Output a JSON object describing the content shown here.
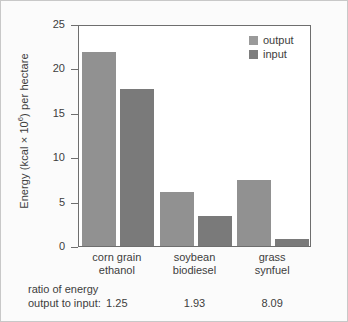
{
  "chart_data": {
    "type": "bar",
    "title": "",
    "xlabel": "",
    "ylabel": "Energy (kcal × 10⁶) per hectare",
    "ylabel_main": "Energy (kcal × 10",
    "ylabel_sup": "6",
    "ylabel_tail": ") per hectare",
    "ylim": [
      0,
      25
    ],
    "yticks": [
      25,
      20,
      15,
      10,
      5,
      0
    ],
    "grid": false,
    "legend_position": "top-right",
    "categories": [
      "corn grain ethanol",
      "soybean biodiesel",
      "grass synfuel"
    ],
    "categories_lines": [
      [
        "corn grain",
        "ethanol"
      ],
      [
        "soybean",
        "biodiesel"
      ],
      [
        "grass",
        "synfuel"
      ]
    ],
    "series": [
      {
        "name": "output",
        "color": "#919191",
        "values": [
          22.0,
          6.2,
          7.6
        ]
      },
      {
        "name": "input",
        "color": "#7a7a7a",
        "values": [
          17.8,
          3.5,
          0.9
        ]
      }
    ],
    "annotations": {
      "ratio_caption_line1": "ratio of energy",
      "ratio_caption_line2": "output to input:",
      "ratio_values": [
        "1.25",
        "1.93",
        "8.09"
      ]
    }
  },
  "legend": {
    "items": [
      {
        "label": "output",
        "color": "#9a9a9a"
      },
      {
        "label": "input",
        "color": "#7d7d7d"
      }
    ]
  },
  "colors": {
    "output_bar": "#919191",
    "input_bar": "#7a7a7a",
    "axis": "#6e6e6e",
    "text": "#3d3d3d",
    "figure_background": "#fbfbfb",
    "plot_background": "#ffffff",
    "figure_border": "#c8c8c8"
  }
}
